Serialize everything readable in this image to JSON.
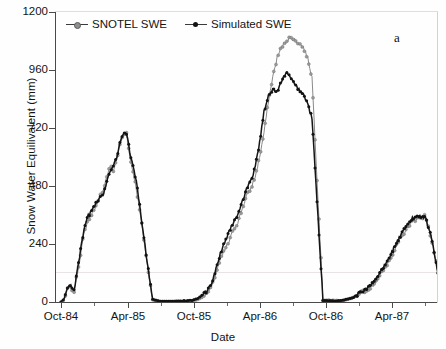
{
  "figure": {
    "panel_label": "a",
    "legend_position": "top-left inside axes"
  },
  "axes": {
    "ylabel": "Snow Water Equilivalent (mm)",
    "xlabel": "Date",
    "yticks": [
      0,
      240,
      480,
      720,
      960,
      1200
    ],
    "ytick_labels": [
      "0",
      "240",
      "480",
      "720",
      "960",
      "1200"
    ],
    "xtick_labels": [
      "Oct-84",
      "Apr-85",
      "Oct-85",
      "Apr-86",
      "Oct-86",
      "Apr-87"
    ]
  },
  "chart_data": {
    "type": "line",
    "title": "",
    "xlabel": "Date",
    "ylabel": "Snow Water Equilivalent (mm)",
    "ylim": [
      0,
      1200
    ],
    "xlim": [
      "Oct-84",
      "Oct-87"
    ],
    "grid": false,
    "legend": [
      "SNOTEL SWE",
      "Simulated SWE"
    ],
    "legend_markers": [
      "open-circle-line",
      "filled-circle-line"
    ],
    "colors": {
      "snotel": "#8a8a8a",
      "simulated": "#151515"
    },
    "x_tick_labels": [
      "Oct-84",
      "Apr-85",
      "Oct-85",
      "Apr-86",
      "Oct-86",
      "Apr-87"
    ],
    "x_tick_months": [
      0,
      6,
      12,
      18,
      24,
      30
    ],
    "x_unit": "months since Oct-1984",
    "series": [
      {
        "name": "SNOTEL SWE",
        "x": [
          0.0,
          0.3,
          0.6,
          0.9,
          1.2,
          1.5,
          1.8,
          2.1,
          2.4,
          2.7,
          3.0,
          3.3,
          3.6,
          3.9,
          4.2,
          4.5,
          4.8,
          5.1,
          5.4,
          5.7,
          6.0,
          6.3,
          6.6,
          6.9,
          7.2,
          7.5,
          7.8,
          8.1,
          8.4,
          9.0,
          10.0,
          11.0,
          12.0,
          12.6,
          13.0,
          13.4,
          13.8,
          14.2,
          14.6,
          15.0,
          15.4,
          15.8,
          16.2,
          16.6,
          17.0,
          17.4,
          17.8,
          18.2,
          18.6,
          19.0,
          19.4,
          19.8,
          20.2,
          20.6,
          21.0,
          21.4,
          21.8,
          22.2,
          22.6,
          23.0,
          24.0,
          25.0,
          25.6,
          26.2,
          26.8,
          27.4,
          28.0,
          28.6,
          29.2,
          29.8,
          30.4,
          31.0,
          31.6,
          32.2,
          32.8,
          33.4,
          34.0,
          35.0
        ],
        "y": [
          0,
          10,
          55,
          60,
          45,
          120,
          200,
          280,
          330,
          355,
          385,
          400,
          440,
          470,
          520,
          560,
          545,
          590,
          650,
          690,
          705,
          600,
          540,
          470,
          380,
          290,
          190,
          95,
          10,
          2,
          2,
          3,
          5,
          12,
          22,
          35,
          60,
          120,
          175,
          215,
          250,
          300,
          330,
          385,
          440,
          470,
          520,
          600,
          700,
          830,
          930,
          1010,
          1055,
          1080,
          1095,
          1085,
          1070,
          1055,
          1010,
          930,
          8,
          6,
          5,
          10,
          18,
          35,
          52,
          70,
          110,
          150,
          200,
          255,
          300,
          335,
          350,
          355,
          250,
          8
        ],
        "marker": "open-circle"
      },
      {
        "name": "Simulated SWE",
        "x": [
          0.0,
          0.3,
          0.6,
          0.9,
          1.2,
          1.5,
          1.8,
          2.1,
          2.4,
          2.7,
          3.0,
          3.3,
          3.6,
          3.9,
          4.2,
          4.5,
          4.8,
          5.1,
          5.4,
          5.7,
          6.0,
          6.3,
          6.6,
          6.9,
          7.2,
          7.5,
          7.8,
          8.1,
          8.4,
          9.0,
          10.0,
          11.0,
          12.0,
          12.6,
          13.0,
          13.4,
          13.8,
          14.2,
          14.6,
          15.0,
          15.4,
          15.8,
          16.2,
          16.6,
          17.0,
          17.4,
          17.8,
          18.2,
          18.6,
          19.0,
          19.4,
          19.8,
          20.2,
          20.6,
          21.0,
          21.4,
          21.8,
          22.2,
          22.6,
          23.0,
          24.0,
          25.0,
          25.6,
          26.2,
          26.8,
          27.4,
          28.0,
          28.6,
          29.2,
          29.8,
          30.4,
          31.0,
          31.6,
          32.2,
          32.8,
          33.4,
          34.0,
          35.0
        ],
        "y": [
          0,
          15,
          60,
          70,
          50,
          130,
          215,
          295,
          350,
          370,
          395,
          415,
          430,
          450,
          500,
          545,
          565,
          600,
          660,
          695,
          700,
          620,
          560,
          500,
          400,
          300,
          200,
          100,
          12,
          3,
          3,
          4,
          6,
          15,
          30,
          48,
          75,
          140,
          200,
          250,
          290,
          330,
          360,
          415,
          465,
          500,
          560,
          660,
          790,
          850,
          880,
          870,
          910,
          950,
          930,
          900,
          880,
          860,
          820,
          760,
          7,
          5,
          5,
          12,
          20,
          38,
          58,
          78,
          120,
          160,
          215,
          265,
          310,
          345,
          358,
          350,
          255,
          6
        ],
        "marker": "filled-circle"
      }
    ],
    "annotations": [
      {
        "text": "a",
        "position": "top-right"
      }
    ]
  }
}
